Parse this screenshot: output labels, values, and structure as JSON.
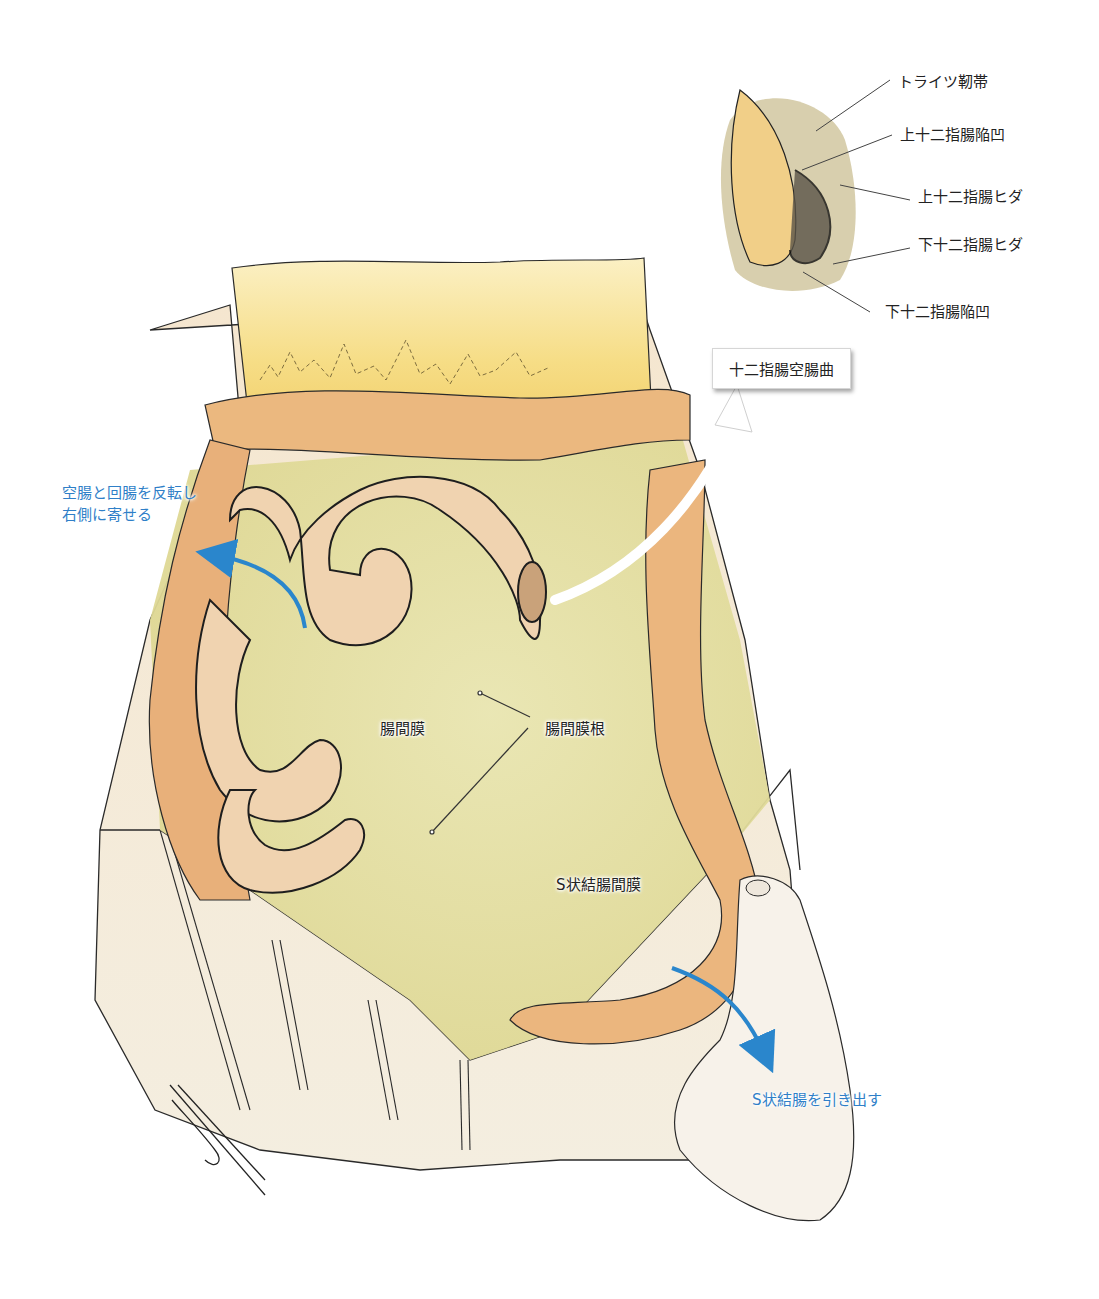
{
  "figure": {
    "inset": {
      "labels": [
        {
          "id": "treitz",
          "text": "トライツ靭帯"
        },
        {
          "id": "sup-recess",
          "text": "上十二指腸陥凹"
        },
        {
          "id": "sup-fold",
          "text": "上十二指腸ヒダ"
        },
        {
          "id": "inf-fold",
          "text": "下十二指腸ヒダ"
        },
        {
          "id": "inf-recess",
          "text": "下十二指腸陥凹"
        }
      ]
    },
    "callout": {
      "text": "十二指腸空腸曲"
    },
    "main_labels": {
      "mesentery": "腸間膜",
      "mesentery_root": "腸間膜根",
      "sigmoid_mesocolon": "S状結腸間膜"
    },
    "instructions": {
      "flip_small_bowel_line1": "空腸と回腸を反転し",
      "flip_small_bowel_line2": "右側に寄せる",
      "pull_sigmoid": "S状結腸を引き出す"
    },
    "signature": "F. Nagai",
    "caption": "",
    "colors": {
      "instruction_blue": "#2f7fc8",
      "arrow_blue": "#2a86cc",
      "mesentery_yellow": "#e6e2a4",
      "colon_orange": "#eab37c",
      "small_bowel_peach": "#f0d3b0",
      "drape": "#f3ead8",
      "omentum_yellow": "#f7e08c"
    }
  }
}
